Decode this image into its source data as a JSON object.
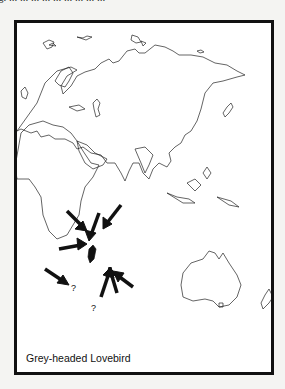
{
  "page": {
    "top_text_fragment": "g. ... ... ... ... ... ... ... ... ..."
  },
  "figure": {
    "caption": "Grey-headed Lovebird",
    "map_region": "Eurasia, Africa, Indian Ocean, Australia",
    "arrow_color": "#111111",
    "outline_color": "#222222",
    "annotations": [
      {
        "type": "question-mark",
        "label": "?",
        "location": "South Africa coast"
      },
      {
        "type": "question-mark",
        "label": "?",
        "location": "South of Madagascar"
      }
    ],
    "arrows_count": 8
  }
}
